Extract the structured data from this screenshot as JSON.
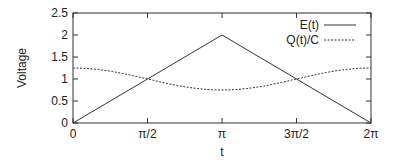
{
  "chart_data": {
    "type": "line",
    "title": "",
    "xlabel": "t",
    "ylabel": "Voltage",
    "xlim": [
      0,
      6.283185
    ],
    "ylim": [
      0,
      2.5
    ],
    "grid": false,
    "legend_position": "top-right inside",
    "x_ticks": [
      {
        "value": 0,
        "label": "0"
      },
      {
        "value": 1.570796,
        "label": "π/2"
      },
      {
        "value": 3.141593,
        "label": "π"
      },
      {
        "value": 4.712389,
        "label": "3π/2"
      },
      {
        "value": 6.283185,
        "label": "2π"
      }
    ],
    "y_ticks": [
      {
        "value": 0,
        "label": "0"
      },
      {
        "value": 0.5,
        "label": "0.5"
      },
      {
        "value": 1,
        "label": "1"
      },
      {
        "value": 1.5,
        "label": "1.5"
      },
      {
        "value": 2,
        "label": "2"
      },
      {
        "value": 2.5,
        "label": "2.5"
      }
    ],
    "series": [
      {
        "name": "E(t)",
        "style": "solid",
        "x": [
          0,
          3.141593,
          6.283185
        ],
        "y": [
          0,
          2,
          0
        ]
      },
      {
        "name": "Q(t)/C",
        "style": "dashed",
        "x": [
          0,
          0.785398,
          1.570796,
          2.356194,
          3.141593,
          3.926991,
          4.712389,
          5.497787,
          6.283185
        ],
        "y": [
          1.25,
          1.18,
          0.97,
          0.82,
          0.76,
          0.85,
          1.04,
          1.2,
          1.25
        ]
      }
    ]
  }
}
